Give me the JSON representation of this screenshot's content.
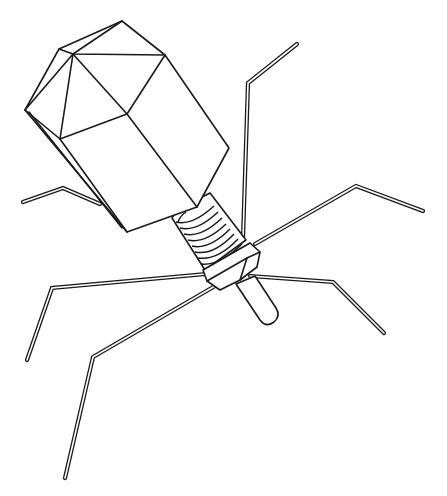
{
  "figure": {
    "parts": [
      "head",
      "tail-sheath",
      "baseplate",
      "tail-tube",
      "tail-fibers"
    ],
    "colors": {
      "line": "#1a1a1a",
      "background": "#ffffff"
    }
  }
}
